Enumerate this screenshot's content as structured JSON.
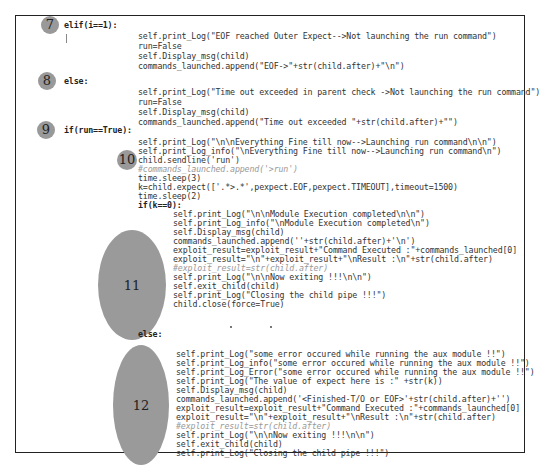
{
  "badges": [
    {
      "label": "7"
    },
    {
      "label": "8"
    },
    {
      "label": "9"
    },
    {
      "label": "10"
    },
    {
      "label": "11"
    },
    {
      "label": "12"
    }
  ],
  "code": {
    "elif_header": "elif(i==1):",
    "elif_lines": [
      "self.print_Log(\"EOF reached Outer Expect-->Not launching the run command\")",
      "run=False",
      "self.Display_msg(child)",
      "commands_launched.append(\"EOF->\"+str(child.after)+\"\\n\")"
    ],
    "else1_header": "else:",
    "else1_lines": [
      "self.print_Log(\"Time out exceeded in parent check ->Not launching the run command\")",
      "run=False",
      "self.Display_msg(child)",
      "commands_launched.append(\"Time out exceeded \"+str(child.after)+\"\")"
    ],
    "if_header": "if(run==True):",
    "if_lines": [
      "self.print_Log(\"\\n\\nEverything Fine till now-->Launching run command\\n\\n\")",
      "self.print_Log_info(\"\\nEverything Fine till now-->Launching run command\\n\")",
      "child.sendline('run')",
      "#commands_launched.append('>run')",
      "time.sleep(3)",
      "k=child.expect(['.*>.*',pexpect.EOF,pexpect.TIMEOUT],timeout=1500)",
      "time.sleep(2)",
      "if(k==0):"
    ],
    "k0_lines": [
      "self.print_Log(\"\\n\\nModule Execution completed\\n\\n\")",
      "self.print_Log_info(\"\\nModule Execution completed\\n\")",
      "self.Display_msg(child)",
      "commands_launched.append(''+str(child.after)+'\\n')",
      "exploit_result=exploit_result+\"Command Executed :\"+commands_launched[0]",
      "exploit_result=\"\\n\"+exploit_result+\"\\nResult :\\n\"+str(child.after)",
      "#exploit_result=str(child.after)",
      "self.print_Log(\"\\n\\nNow exiting !!!\\n\\n\")",
      "self.exit_child(child)",
      "self.print_Log(\"Closing the child pipe !!!\")",
      "child.close(force=True)"
    ],
    "else2_header": "else:",
    "else2_lines": [
      "self.print_Log(\"some error occured while running the aux module !!\")",
      "self.print_Log_info(\"some error occured while running the aux module !!\")",
      "self.print_Log_Error(\"some error occured while running the aux module !!\")",
      "self.print_Log(\"The value of expect here is :\" +str(k))",
      "self.Display_msg(child)",
      "commands_launched.append('<Finished-T/O or EOF>'+str(child.after)+'')",
      "exploit_result=exploit_result+\"Command Executed :\"+commands_launched[0]",
      "exploit_result=\"\\n\"+exploit_result+\"\\nResult :\\n\"+str(child.after)",
      "#exploit_result=str(child.after)",
      "self.print_Log(\"\\n\\nNow exiting !!!\\n\\n\")",
      "self.exit_child(child)",
      "self.print_Log(\"Closing the child pipe !!!\")"
    ]
  },
  "colors": {
    "badge": "#999999",
    "frame": "#222222",
    "string": "#888888",
    "comment": "#999999"
  }
}
